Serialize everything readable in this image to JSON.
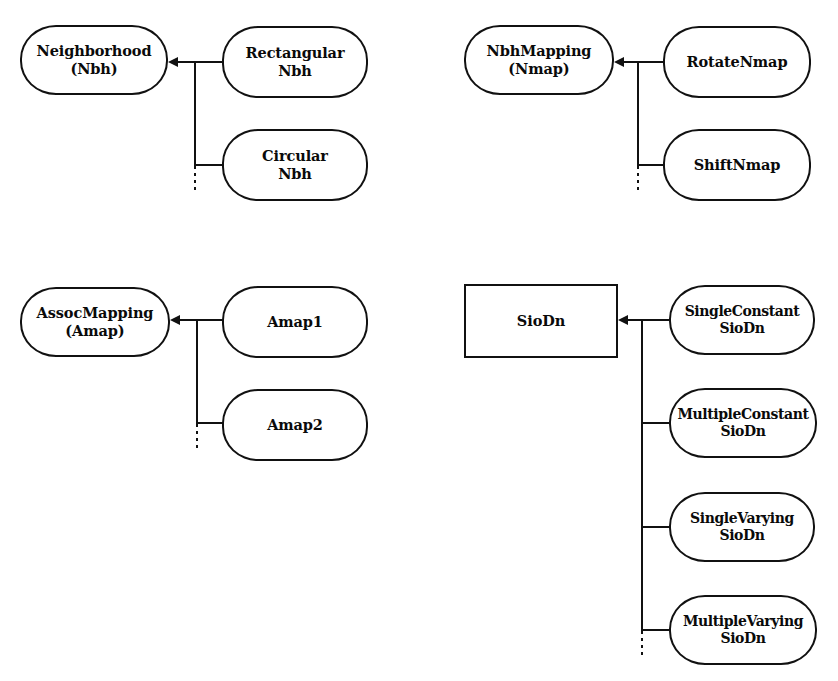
{
  "figure": {
    "background_color": "#ffffff",
    "line_color": "#111111",
    "text_color": "#0a0a0a",
    "width": 838,
    "height": 681
  },
  "groups": [
    {
      "id": "neighborhood",
      "parent": {
        "label": "Neighborhood\n(Nbh)",
        "shape": "rounded"
      },
      "children": [
        {
          "label": "Rectangular\nNbh",
          "shape": "rounded"
        },
        {
          "label": "Circular\nNbh",
          "shape": "rounded"
        }
      ],
      "continuation": "dotted"
    },
    {
      "id": "nbhmapping",
      "parent": {
        "label": "NbhMapping\n(Nmap)",
        "shape": "rounded"
      },
      "children": [
        {
          "label": "RotateNmap",
          "shape": "rounded"
        },
        {
          "label": "ShiftNmap",
          "shape": "rounded"
        }
      ],
      "continuation": "dotted"
    },
    {
      "id": "assocmapping",
      "parent": {
        "label": "AssocMapping\n(Amap)",
        "shape": "rounded"
      },
      "children": [
        {
          "label": "Amap1",
          "shape": "rounded"
        },
        {
          "label": "Amap2",
          "shape": "rounded"
        }
      ],
      "continuation": "dotted"
    },
    {
      "id": "siodn",
      "parent": {
        "label": "SioDn",
        "shape": "rectangle"
      },
      "children": [
        {
          "label": "SingleConstant\nSioDn",
          "shape": "rounded"
        },
        {
          "label": "MultipleConstant\nSioDn",
          "shape": "rounded"
        },
        {
          "label": "SingleVarying\nSioDn",
          "shape": "rounded"
        },
        {
          "label": "MultipleVarying\nSioDn",
          "shape": "rounded"
        }
      ],
      "continuation": "dotted"
    }
  ]
}
